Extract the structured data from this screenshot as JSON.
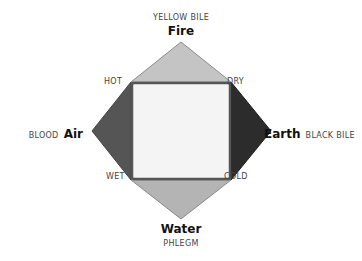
{
  "top": {
    "humor": "YELLOW BILE",
    "element": "Fire"
  },
  "bottom": {
    "element": "Water",
    "humor": "PHLEGM"
  },
  "left": {
    "humor": "BLOOD",
    "element": "Air"
  },
  "right": {
    "element": "Earth",
    "humor": "BLACK BILE"
  },
  "corners": {
    "top_left": "HOT",
    "top_right": "DRY",
    "bottom_left": "WET",
    "bottom_right": "COLD"
  },
  "colors": {
    "fire": "#c4c4c4",
    "water": "#b4b4b4",
    "air": "#555555",
    "earth": "#2c2c2c",
    "center": "#f4f4f4",
    "border": "#555555"
  }
}
